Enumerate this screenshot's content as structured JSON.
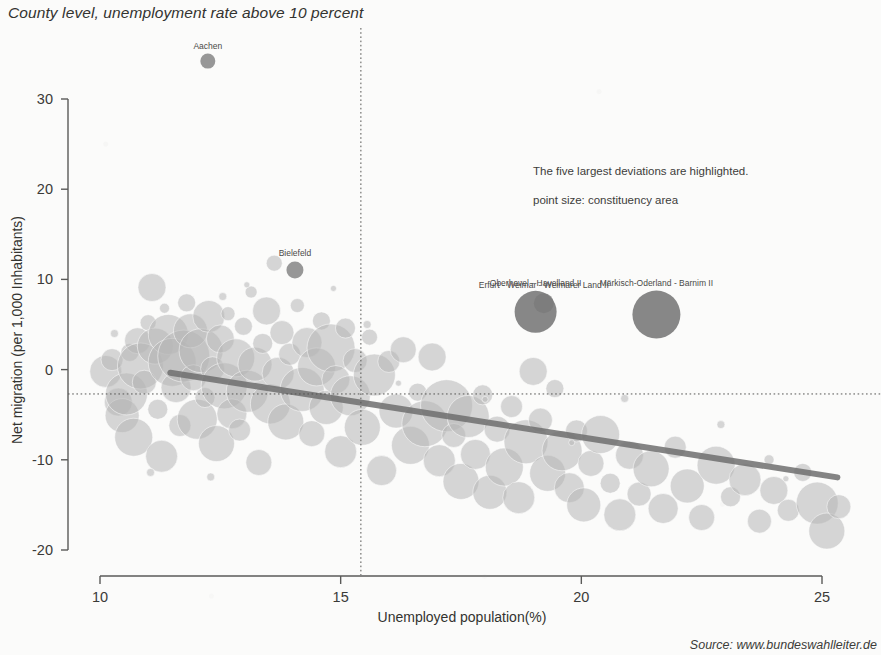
{
  "title": "County level, unemployment rate above 10 percent",
  "source": "Source: www.bundeswahlleiter.de",
  "notes": {
    "deviations": "The five largest deviations are highlighted.",
    "point_size": "point size: constituency area"
  },
  "colors": {
    "background": "#fbfbfa",
    "bubble_fill": "#b6b6b6",
    "bubble_highlight": "#8c8c8c",
    "bubble_highlight_dark": "#7a7a7a",
    "trend_line": "#6e6e6e",
    "axis": "#5a5a58",
    "reference_line": "#555553",
    "text": "#3b3b3b"
  },
  "chart_data": {
    "type": "scatter",
    "title": "County level, unemployment rate above 10 percent",
    "subtitle": "",
    "xlabel": "Unemployed population(%)",
    "ylabel": "Net migration (per 1,000 Inhabitants)",
    "xlim": [
      9.4,
      25.6
    ],
    "ylim": [
      -21.5,
      35.5
    ],
    "xticks": [
      10,
      15,
      20,
      25
    ],
    "yticks": [
      30,
      20,
      10,
      0,
      -10,
      -20
    ],
    "grid": false,
    "legend": "none",
    "size_encoding": "constituency area",
    "annotations": [
      "The five largest deviations are highlighted.",
      "point size: constituency area"
    ],
    "reference_lines": [
      {
        "orientation": "vertical",
        "x": 15.42,
        "style": "dotted"
      },
      {
        "orientation": "horizontal",
        "y": -2.7,
        "style": "dotted"
      }
    ],
    "trend_line": {
      "style": "solid",
      "width": 6,
      "x0": 11.46,
      "y0": -0.35,
      "x1": 25.32,
      "y1": -11.95
    },
    "labeled_points": [
      {
        "label": "Aachen",
        "x": 12.24,
        "y": 34.2,
        "r": 7.5,
        "highlight": true
      },
      {
        "label": "Bielefeld",
        "x": 14.05,
        "y": 11.05,
        "r": 8.5,
        "highlight": true
      },
      {
        "label": "Erfurt - Weimar - Weimarer Land II",
        "x": 19.22,
        "y": 7.35,
        "r": 10,
        "highlight": true
      },
      {
        "label": "Oberhavel - Havelland II",
        "x": 19.05,
        "y": 6.4,
        "r": 21,
        "highlight": true
      },
      {
        "label": "Märkisch-Oderland - Barnim II",
        "x": 21.56,
        "y": 6.1,
        "r": 24,
        "highlight": true
      }
    ],
    "points": [
      {
        "x": 10.12,
        "y": -0.2,
        "r": 16
      },
      {
        "x": 10.25,
        "y": 1.1,
        "r": 11
      },
      {
        "x": 10.38,
        "y": -3.6,
        "r": 14
      },
      {
        "x": 10.46,
        "y": -5.1,
        "r": 17
      },
      {
        "x": 10.55,
        "y": -2.7,
        "r": 21
      },
      {
        "x": 10.62,
        "y": 1.9,
        "r": 9
      },
      {
        "x": 10.7,
        "y": -7.5,
        "r": 19
      },
      {
        "x": 10.78,
        "y": 3.2,
        "r": 13
      },
      {
        "x": 10.84,
        "y": 0.4,
        "r": 23
      },
      {
        "x": 10.92,
        "y": -1.4,
        "r": 12
      },
      {
        "x": 11.0,
        "y": 5.2,
        "r": 8
      },
      {
        "x": 11.08,
        "y": 9.1,
        "r": 14
      },
      {
        "x": 11.15,
        "y": 2.6,
        "r": 18
      },
      {
        "x": 11.2,
        "y": -4.4,
        "r": 10
      },
      {
        "x": 11.28,
        "y": -9.6,
        "r": 16
      },
      {
        "x": 11.34,
        "y": 6.8,
        "r": 5
      },
      {
        "x": 11.42,
        "y": 3.9,
        "r": 20
      },
      {
        "x": 11.5,
        "y": 0.8,
        "r": 24
      },
      {
        "x": 11.58,
        "y": -2.0,
        "r": 15
      },
      {
        "x": 11.66,
        "y": -6.2,
        "r": 11
      },
      {
        "x": 11.74,
        "y": 1.5,
        "r": 26
      },
      {
        "x": 11.8,
        "y": 7.4,
        "r": 9
      },
      {
        "x": 11.88,
        "y": 4.3,
        "r": 17
      },
      {
        "x": 11.94,
        "y": -0.9,
        "r": 13
      },
      {
        "x": 12.02,
        "y": -5.5,
        "r": 20
      },
      {
        "x": 12.1,
        "y": 2.1,
        "r": 22
      },
      {
        "x": 12.18,
        "y": -3.1,
        "r": 10
      },
      {
        "x": 12.26,
        "y": 5.9,
        "r": 16
      },
      {
        "x": 12.34,
        "y": 0.1,
        "r": 12
      },
      {
        "x": 12.42,
        "y": -8.2,
        "r": 18
      },
      {
        "x": 12.5,
        "y": 3.4,
        "r": 14
      },
      {
        "x": 12.58,
        "y": -1.8,
        "r": 23
      },
      {
        "x": 12.66,
        "y": 6.2,
        "r": 7
      },
      {
        "x": 12.74,
        "y": -4.9,
        "r": 15
      },
      {
        "x": 12.82,
        "y": 1.3,
        "r": 19
      },
      {
        "x": 12.9,
        "y": -6.7,
        "r": 11
      },
      {
        "x": 12.98,
        "y": 4.8,
        "r": 9
      },
      {
        "x": 13.06,
        "y": -2.4,
        "r": 21
      },
      {
        "x": 13.14,
        "y": 8.6,
        "r": 6
      },
      {
        "x": 13.22,
        "y": 0.6,
        "r": 17
      },
      {
        "x": 13.3,
        "y": -10.3,
        "r": 13
      },
      {
        "x": 13.38,
        "y": 2.9,
        "r": 10
      },
      {
        "x": 13.46,
        "y": 6.5,
        "r": 14
      },
      {
        "x": 13.54,
        "y": -3.8,
        "r": 20
      },
      {
        "x": 13.62,
        "y": 11.8,
        "r": 8
      },
      {
        "x": 13.7,
        "y": -0.4,
        "r": 16
      },
      {
        "x": 13.78,
        "y": 4.1,
        "r": 12
      },
      {
        "x": 13.86,
        "y": -5.8,
        "r": 18
      },
      {
        "x": 13.94,
        "y": 1.7,
        "r": 11
      },
      {
        "x": 14.1,
        "y": 7.1,
        "r": 7
      },
      {
        "x": 14.2,
        "y": -2.2,
        "r": 22
      },
      {
        "x": 14.3,
        "y": 3.0,
        "r": 15
      },
      {
        "x": 14.4,
        "y": -7.1,
        "r": 13
      },
      {
        "x": 14.5,
        "y": 0.3,
        "r": 19
      },
      {
        "x": 14.6,
        "y": 5.4,
        "r": 9
      },
      {
        "x": 14.7,
        "y": -4.2,
        "r": 17
      },
      {
        "x": 14.8,
        "y": 2.4,
        "r": 24
      },
      {
        "x": 14.9,
        "y": -1.1,
        "r": 14
      },
      {
        "x": 15.0,
        "y": -9.1,
        "r": 16
      },
      {
        "x": 15.1,
        "y": 4.6,
        "r": 10
      },
      {
        "x": 15.2,
        "y": -2.9,
        "r": 20
      },
      {
        "x": 15.3,
        "y": 1.0,
        "r": 12
      },
      {
        "x": 15.45,
        "y": -6.4,
        "r": 18
      },
      {
        "x": 15.6,
        "y": 3.6,
        "r": 8
      },
      {
        "x": 15.7,
        "y": -0.6,
        "r": 21
      },
      {
        "x": 15.85,
        "y": -11.2,
        "r": 15
      },
      {
        "x": 16.0,
        "y": 0.9,
        "r": 11
      },
      {
        "x": 16.15,
        "y": -4.6,
        "r": 17
      },
      {
        "x": 16.3,
        "y": 2.2,
        "r": 13
      },
      {
        "x": 16.45,
        "y": -8.4,
        "r": 19
      },
      {
        "x": 16.6,
        "y": -2.5,
        "r": 9
      },
      {
        "x": 16.75,
        "y": -6.0,
        "r": 23
      },
      {
        "x": 16.9,
        "y": 1.4,
        "r": 14
      },
      {
        "x": 17.05,
        "y": -10.1,
        "r": 16
      },
      {
        "x": 17.2,
        "y": -4.0,
        "r": 26
      },
      {
        "x": 17.35,
        "y": -7.3,
        "r": 12
      },
      {
        "x": 17.5,
        "y": -12.4,
        "r": 18
      },
      {
        "x": 17.65,
        "y": -5.2,
        "r": 21
      },
      {
        "x": 17.8,
        "y": -9.4,
        "r": 15
      },
      {
        "x": 17.95,
        "y": -2.8,
        "r": 10
      },
      {
        "x": 18.1,
        "y": -13.6,
        "r": 17
      },
      {
        "x": 18.25,
        "y": -6.6,
        "r": 13
      },
      {
        "x": 18.4,
        "y": -10.8,
        "r": 19
      },
      {
        "x": 18.55,
        "y": -4.1,
        "r": 11
      },
      {
        "x": 18.7,
        "y": -14.2,
        "r": 16
      },
      {
        "x": 18.85,
        "y": -8.0,
        "r": 22
      },
      {
        "x": 19.0,
        "y": -0.2,
        "r": 14
      },
      {
        "x": 19.15,
        "y": -5.6,
        "r": 12
      },
      {
        "x": 19.3,
        "y": -11.5,
        "r": 18
      },
      {
        "x": 19.45,
        "y": -2.1,
        "r": 9
      },
      {
        "x": 19.6,
        "y": -9.0,
        "r": 20
      },
      {
        "x": 19.75,
        "y": -13.1,
        "r": 15
      },
      {
        "x": 19.9,
        "y": -6.8,
        "r": 11
      },
      {
        "x": 20.05,
        "y": -15.0,
        "r": 17
      },
      {
        "x": 20.2,
        "y": -10.4,
        "r": 13
      },
      {
        "x": 20.4,
        "y": -7.2,
        "r": 19
      },
      {
        "x": 20.6,
        "y": -12.6,
        "r": 10
      },
      {
        "x": 20.8,
        "y": -16.1,
        "r": 16
      },
      {
        "x": 21.0,
        "y": -9.5,
        "r": 14
      },
      {
        "x": 21.2,
        "y": -13.8,
        "r": 12
      },
      {
        "x": 21.45,
        "y": -11.0,
        "r": 18
      },
      {
        "x": 21.7,
        "y": -15.4,
        "r": 15
      },
      {
        "x": 21.95,
        "y": -8.6,
        "r": 11
      },
      {
        "x": 22.2,
        "y": -12.9,
        "r": 17
      },
      {
        "x": 22.5,
        "y": -16.4,
        "r": 13
      },
      {
        "x": 22.8,
        "y": -10.6,
        "r": 19
      },
      {
        "x": 23.1,
        "y": -14.1,
        "r": 10
      },
      {
        "x": 23.4,
        "y": -12.2,
        "r": 16
      },
      {
        "x": 23.7,
        "y": -16.8,
        "r": 12
      },
      {
        "x": 24.0,
        "y": -13.4,
        "r": 14
      },
      {
        "x": 24.3,
        "y": -15.6,
        "r": 11
      },
      {
        "x": 24.6,
        "y": -11.4,
        "r": 9
      },
      {
        "x": 24.9,
        "y": -14.8,
        "r": 21
      },
      {
        "x": 25.1,
        "y": -17.9,
        "r": 18
      },
      {
        "x": 25.35,
        "y": -15.2,
        "r": 12
      },
      {
        "x": 11.05,
        "y": -11.4,
        "r": 4
      },
      {
        "x": 12.3,
        "y": -11.9,
        "r": 4
      },
      {
        "x": 13.05,
        "y": 9.4,
        "r": 3
      },
      {
        "x": 14.85,
        "y": 9.0,
        "r": 3
      },
      {
        "x": 16.2,
        "y": -1.5,
        "r": 3
      },
      {
        "x": 18.0,
        "y": -3.3,
        "r": 3
      },
      {
        "x": 20.9,
        "y": -3.2,
        "r": 4
      },
      {
        "x": 22.9,
        "y": -6.1,
        "r": 4
      },
      {
        "x": 24.25,
        "y": -12.1,
        "r": 3
      },
      {
        "x": 19.8,
        "y": -8.1,
        "r": 3
      },
      {
        "x": 10.3,
        "y": 4.0,
        "r": 4
      },
      {
        "x": 12.55,
        "y": 8.1,
        "r": 4
      },
      {
        "x": 15.55,
        "y": 5.0,
        "r": 4
      },
      {
        "x": 23.9,
        "y": -10.0,
        "r": 5
      }
    ]
  },
  "axes": {
    "x_tick_labels": [
      "10",
      "15",
      "20",
      "25"
    ],
    "y_tick_labels": [
      "30",
      "20",
      "10",
      "0",
      "-10",
      "-20"
    ],
    "x_title": "Unemployed population(%)",
    "y_title": "Net migration (per 1,000 Inhabitants)"
  }
}
